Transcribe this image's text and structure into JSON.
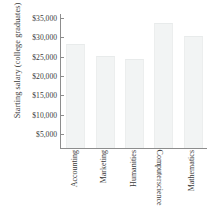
{
  "chart_data": {
    "type": "bar",
    "title": "",
    "xlabel": "",
    "ylabel": "Starting salary (college graduates)",
    "categories": [
      "Accounting",
      "Marketing",
      "Humanities",
      "Computer science",
      "Mathematics"
    ],
    "values": [
      28000,
      25000,
      24000,
      33500,
      30000
    ],
    "ylim": [
      1400,
      36000
    ],
    "ytick_values": [
      5000,
      10000,
      15000,
      20000,
      25000,
      30000,
      35000
    ],
    "ytick_labels": [
      "$5,000",
      "$10,000",
      "$15,000",
      "$20,000",
      "$25,000",
      "$30,000",
      "$35,000"
    ],
    "grid": false,
    "legend": false,
    "bar_color": "#f2f4f4",
    "axis_color": "#8d8d8d",
    "text_color": "#3a3a3a"
  },
  "axis": {
    "y_title": "Starting salary (college graduates)"
  },
  "x_labels": [
    {
      "full": "Accounting",
      "line1": "Accounting",
      "line2": ""
    },
    {
      "full": "Marketing",
      "line1": "Marketing",
      "line2": ""
    },
    {
      "full": "Humanities",
      "line1": "Humanities",
      "line2": ""
    },
    {
      "full": "Computer science",
      "line1": "Computer",
      "line2": "science"
    },
    {
      "full": "Mathematics",
      "line1": "Mathematics",
      "line2": ""
    }
  ]
}
